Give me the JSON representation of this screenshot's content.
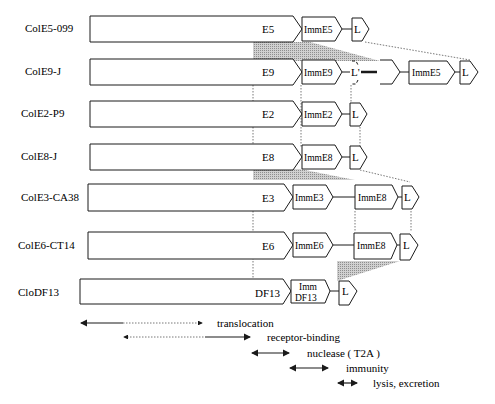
{
  "figure": {
    "rows": [
      {
        "name": "ColE5-099",
        "toxin": "E5",
        "imm": [
          "ImmE5"
        ],
        "lysis": "L"
      },
      {
        "name": "ColE9-J",
        "toxin": "E9",
        "imm": [
          "ImmE9"
        ],
        "lysis": "L'",
        "extra": {
          "imm": "ImmE5",
          "lysis": "L"
        }
      },
      {
        "name": "ColE2-P9",
        "toxin": "E2",
        "imm": [
          "ImmE2"
        ],
        "lysis": "L"
      },
      {
        "name": "ColE8-J",
        "toxin": "E8",
        "imm": [
          "ImmE8"
        ],
        "lysis": "L"
      },
      {
        "name": "ColE3-CA38",
        "toxin": "E3",
        "imm": [
          "ImmE3",
          "ImmE8"
        ],
        "lysis": "L"
      },
      {
        "name": "ColE6-CT14",
        "toxin": "E6",
        "imm": [
          "ImmE6",
          "ImmE8"
        ],
        "lysis": "L"
      },
      {
        "name": "CloDF13",
        "toxin": "DF13",
        "imm": [
          "Imm DF13"
        ],
        "imm_line1": "Imm",
        "imm_line2": "DF13",
        "lysis": "L"
      }
    ],
    "legend": [
      {
        "label": "translocation"
      },
      {
        "label": "receptor-binding"
      },
      {
        "label": "nuclease ( T2A )"
      },
      {
        "label": "immunity"
      },
      {
        "label": "lysis, excretion"
      }
    ],
    "colors": {
      "stroke": "#1a1a1a",
      "shade": "#b5b5b5",
      "dotted": "#555555"
    }
  }
}
